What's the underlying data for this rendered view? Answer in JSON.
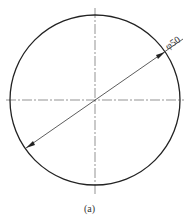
{
  "diagram": {
    "type": "circle-diameter-dimension",
    "dimension_label": "φ50",
    "caption": "(a)",
    "colors": {
      "line": "#222222",
      "centerline": "#555555"
    }
  }
}
